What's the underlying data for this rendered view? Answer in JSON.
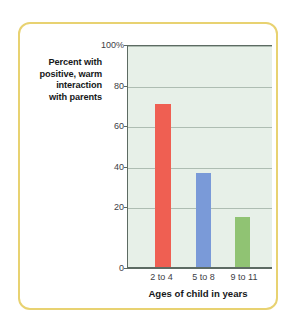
{
  "figure": {
    "frame_color": "#e8d271",
    "background": "#ffffff"
  },
  "chart_data": {
    "type": "bar",
    "title": "",
    "subtitle": "",
    "categories": [
      "2 to 4",
      "5 to 8",
      "9 to 11"
    ],
    "values": [
      81,
      47,
      25
    ],
    "series": [
      {
        "name": "Percent with positive, warm interaction with parents",
        "values": [
          81,
          47,
          25
        ]
      }
    ],
    "bar_colors": [
      "#ef5f52",
      "#7a9ad8",
      "#90c373"
    ],
    "xlabel": "Ages of child in years",
    "ylabel": "Percent with positive, warm interaction with parents",
    "ylabel_lines": [
      "Percent with",
      "positive, warm",
      "interaction",
      "with parents"
    ],
    "ylim": [
      0,
      110
    ],
    "yticks": [
      0,
      20,
      40,
      60,
      80,
      100
    ],
    "ytick_labels": [
      "0",
      "20",
      "40",
      "60",
      "80",
      "100%"
    ],
    "grid": true,
    "grid_color": "#aebdb2",
    "plot_background": "#e7f0e8",
    "axis_color": "#5d6b63",
    "legend": "none"
  }
}
